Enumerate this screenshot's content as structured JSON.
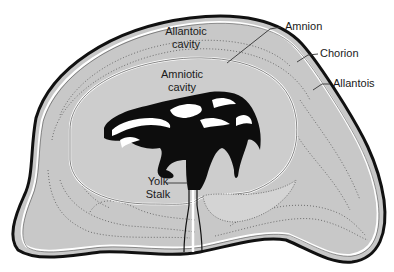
{
  "diagram": {
    "colors": {
      "background": "#ffffff",
      "chorion_fill": "#c8c8c8",
      "amniotic_fill": "#cdcdcd",
      "outline": "#111111",
      "membrane_highlight": "#ffffff",
      "embryo": "#0d0d0d",
      "stipple": "#555555",
      "leader_line": "#333333"
    },
    "labels": {
      "allantoic_cavity_line1": "Allantoic",
      "allantoic_cavity_line2": "cavity",
      "amniotic_cavity_line1": "Amniotic",
      "amniotic_cavity_line2": "cavity",
      "yolk_stalk_line1": "Yolk",
      "yolk_stalk_line2": "Stalk",
      "amnion": "Amnion",
      "chorion": "Chorion",
      "allantois": "Allantois"
    }
  }
}
